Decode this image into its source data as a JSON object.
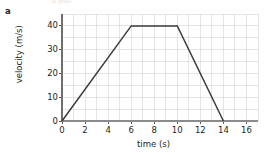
{
  "figure": {
    "part_label": "a",
    "scan_top_caption": "a goal."
  },
  "axes": {
    "x_title": "time (s)",
    "y_title": "velocity (m/s)",
    "x_ticks": [
      "0",
      "2",
      "4",
      "6",
      "8",
      "10",
      "12",
      "14",
      "16"
    ],
    "y_ticks": [
      "0",
      "10",
      "20",
      "30",
      "40"
    ]
  },
  "colors": {
    "data_line": "#3b3b3b",
    "gridline": "#d6d3d6",
    "axis": "#8b8b8b",
    "text": "#231f20",
    "background": "#ffffff"
  },
  "chart_data": {
    "type": "line",
    "title": "",
    "subtitle": "",
    "xlabel": "time (s)",
    "ylabel": "velocity (m/s)",
    "xlim": [
      0,
      17
    ],
    "ylim": [
      0,
      45
    ],
    "xticks": [
      0,
      2,
      4,
      6,
      8,
      10,
      12,
      14,
      16
    ],
    "yticks": [
      0,
      10,
      20,
      30,
      40
    ],
    "grid": true,
    "grid_x_step": 1,
    "grid_y_step": 5,
    "legend": null,
    "series": [
      {
        "name": "velocity",
        "x": [
          0,
          6,
          10,
          14
        ],
        "y": [
          0,
          40,
          40,
          0
        ],
        "color": "#3b3b3b"
      }
    ],
    "annotations": [
      {
        "text": "a",
        "role": "part-label"
      }
    ]
  }
}
